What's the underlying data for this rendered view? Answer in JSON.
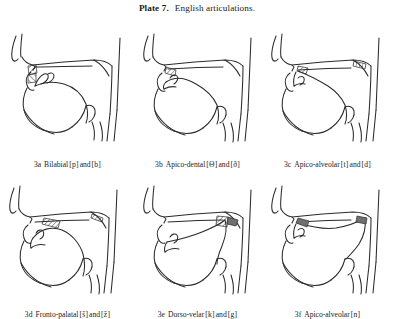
{
  "plate": {
    "lead": "Plate 7.",
    "title": "English articulations."
  },
  "figures": [
    {
      "label": "3a",
      "name": "Bilabial",
      "symbol_open": "[",
      "symbol1": "p",
      "symbol_close": "]",
      "conjunction": "and",
      "symbol2": "b",
      "caption": "3a  Bilabial [p] and [b]",
      "place": "lips",
      "constriction": "bilabial-closure",
      "velum": "raised",
      "shading": "crosshatch"
    },
    {
      "label": "3b",
      "name": "Apico-dental",
      "symbol_open": "[",
      "symbol1": "Θ",
      "symbol_close": "]",
      "conjunction": "and",
      "symbol2": "ð",
      "caption": "3b  Apico-dental [Θ] and [ð]",
      "place": "teeth",
      "constriction": "tongue-tip-to-teeth",
      "velum": "raised",
      "shading": "crosshatch"
    },
    {
      "label": "3c",
      "name": "Apico-alveolar",
      "symbol_open": "[",
      "symbol1": "t",
      "symbol_close": "]",
      "conjunction": "and",
      "symbol2": "d",
      "caption": "3c  Apico-alveolar [t] and [d]",
      "place": "alveolar-ridge",
      "constriction": "tongue-tip-to-alveolar-ridge",
      "velum": "raised",
      "shading": "crosshatch"
    },
    {
      "label": "3d",
      "name": "Fronto-palatal",
      "symbol_open": "[",
      "symbol1": "š",
      "symbol_close": "]",
      "conjunction": "and",
      "symbol2": "ž",
      "caption": "3d  Fronto-palatal [š] and [ž]",
      "place": "hard-palate",
      "constriction": "tongue-front-to-palate",
      "velum": "raised",
      "shading": "crosshatch"
    },
    {
      "label": "3e",
      "name": "Dorso-velar",
      "symbol_open": "[",
      "symbol1": "k",
      "symbol_close": "]",
      "conjunction": "and",
      "symbol2": "g",
      "caption": "3e  Dorso-velar [k] and [g]",
      "place": "velum",
      "constriction": "tongue-back-to-velum",
      "velum": "raised",
      "shading": "crosshatch"
    },
    {
      "label": "3f",
      "name": "Apico-alveolar",
      "symbol_open": "[",
      "symbol1": "n",
      "symbol_close": "]",
      "conjunction": "",
      "symbol2": "",
      "caption": "3f  Apico-alveolar [n]",
      "place": "alveolar-ridge",
      "constriction": "tongue-tip-to-alveolar-ridge",
      "velum": "lowered",
      "shading": "solid"
    }
  ],
  "style": {
    "ink": "#2b2b2b",
    "background": "#ffffff"
  }
}
